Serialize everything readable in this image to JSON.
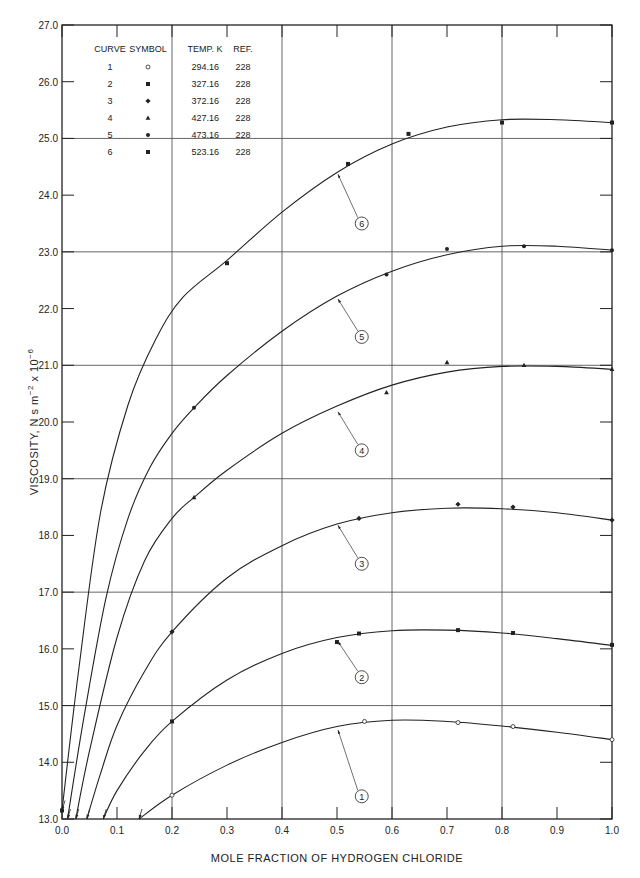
{
  "chart_data": {
    "type": "line",
    "title": "",
    "xlabel": "MOLE FRACTION OF HYDROGEN CHLORIDE",
    "ylabel": "VISCOSITY, N s m^-2 x 10^-6",
    "xlim": [
      0.0,
      1.0
    ],
    "ylim": [
      13.0,
      27.0
    ],
    "x_ticks": [
      "0.0",
      "0.1",
      "0.2",
      "0.3",
      "0.4",
      "0.5",
      "0.6",
      "0.7",
      "0.8",
      "0.9",
      "1.0"
    ],
    "y_ticks": [
      "13.0",
      "14.0",
      "15.0",
      "16.0",
      "17.0",
      "18.0",
      "19.0",
      "20.0",
      "21.0",
      "22.0",
      "23.0",
      "24.0",
      "25.0",
      "26.0",
      "27.0"
    ],
    "grid": {
      "x_major": [
        0.2,
        0.4,
        0.6,
        0.8
      ],
      "y_major": [
        15,
        17,
        19,
        21,
        23,
        25
      ]
    },
    "legend": {
      "position": "upper-left",
      "headers": [
        "CURVE",
        "SYMBOL",
        "TEMP. K",
        "REF."
      ],
      "rows": [
        {
          "curve": "1",
          "symbol": "open-circle",
          "temp": "294.16",
          "ref": "228"
        },
        {
          "curve": "2",
          "symbol": "filled-square",
          "temp": "327.16",
          "ref": "228"
        },
        {
          "curve": "3",
          "symbol": "filled-diamond",
          "temp": "372.16",
          "ref": "228"
        },
        {
          "curve": "4",
          "symbol": "filled-triangle",
          "temp": "427.16",
          "ref": "228"
        },
        {
          "curve": "5",
          "symbol": "filled-circle",
          "temp": "473.16",
          "ref": "228"
        },
        {
          "curve": "6",
          "symbol": "filled-square",
          "temp": "523.16",
          "ref": "228"
        }
      ]
    },
    "series": [
      {
        "name": "1",
        "temp_K": 294.16,
        "symbol": "open-circle",
        "curve": [
          [
            0.14,
            13.0
          ],
          [
            0.2,
            13.42
          ],
          [
            0.3,
            13.95
          ],
          [
            0.4,
            14.35
          ],
          [
            0.5,
            14.63
          ],
          [
            0.6,
            14.74
          ],
          [
            0.7,
            14.72
          ],
          [
            0.8,
            14.64
          ],
          [
            0.9,
            14.53
          ],
          [
            1.0,
            14.4
          ]
        ],
        "points": [
          [
            0.2,
            13.42
          ],
          [
            0.55,
            14.72
          ],
          [
            0.72,
            14.7
          ],
          [
            0.82,
            14.63
          ],
          [
            1.0,
            14.4
          ]
        ],
        "label_pos": [
          0.545,
          13.4
        ],
        "arrow_to": [
          0.5,
          14.62
        ]
      },
      {
        "name": "2",
        "temp_K": 327.16,
        "symbol": "filled-square",
        "curve": [
          [
            0.075,
            13.0
          ],
          [
            0.1,
            13.5
          ],
          [
            0.15,
            14.2
          ],
          [
            0.2,
            14.72
          ],
          [
            0.3,
            15.45
          ],
          [
            0.4,
            15.92
          ],
          [
            0.5,
            16.2
          ],
          [
            0.6,
            16.32
          ],
          [
            0.7,
            16.33
          ],
          [
            0.8,
            16.28
          ],
          [
            0.9,
            16.18
          ],
          [
            1.0,
            16.06
          ]
        ],
        "points": [
          [
            0.2,
            14.72
          ],
          [
            0.5,
            16.12
          ],
          [
            0.54,
            16.27
          ],
          [
            0.72,
            16.33
          ],
          [
            0.82,
            16.28
          ],
          [
            1.0,
            16.07
          ]
        ],
        "label_pos": [
          0.545,
          15.5
        ],
        "arrow_to": [
          0.5,
          16.18
        ]
      },
      {
        "name": "3",
        "temp_K": 372.16,
        "symbol": "filled-diamond",
        "curve": [
          [
            0.045,
            13.0
          ],
          [
            0.07,
            13.8
          ],
          [
            0.1,
            14.65
          ],
          [
            0.15,
            15.6
          ],
          [
            0.2,
            16.3
          ],
          [
            0.3,
            17.25
          ],
          [
            0.4,
            17.82
          ],
          [
            0.5,
            18.2
          ],
          [
            0.6,
            18.4
          ],
          [
            0.7,
            18.48
          ],
          [
            0.8,
            18.47
          ],
          [
            0.9,
            18.4
          ],
          [
            1.0,
            18.27
          ]
        ],
        "points": [
          [
            0.2,
            16.3
          ],
          [
            0.54,
            18.3
          ],
          [
            0.72,
            18.55
          ],
          [
            0.82,
            18.5
          ],
          [
            1.0,
            18.27
          ]
        ],
        "label_pos": [
          0.545,
          17.5
        ],
        "arrow_to": [
          0.5,
          18.23
        ]
      },
      {
        "name": "4",
        "temp_K": 427.16,
        "symbol": "filled-triangle",
        "curve": [
          [
            0.025,
            13.0
          ],
          [
            0.05,
            14.2
          ],
          [
            0.1,
            16.2
          ],
          [
            0.15,
            17.55
          ],
          [
            0.2,
            18.3
          ],
          [
            0.24,
            18.67
          ],
          [
            0.3,
            19.15
          ],
          [
            0.4,
            19.8
          ],
          [
            0.5,
            20.28
          ],
          [
            0.6,
            20.65
          ],
          [
            0.7,
            20.88
          ],
          [
            0.8,
            20.98
          ],
          [
            0.9,
            20.98
          ],
          [
            1.0,
            20.93
          ]
        ],
        "points": [
          [
            0.24,
            18.67
          ],
          [
            0.59,
            20.52
          ],
          [
            0.7,
            21.05
          ],
          [
            0.84,
            21.0
          ],
          [
            1.0,
            20.93
          ]
        ],
        "label_pos": [
          0.545,
          19.5
        ],
        "arrow_to": [
          0.5,
          20.23
        ]
      },
      {
        "name": "5",
        "temp_K": 473.16,
        "symbol": "filled-circle",
        "curve": [
          [
            0.01,
            13.0
          ],
          [
            0.04,
            14.8
          ],
          [
            0.08,
            16.9
          ],
          [
            0.12,
            18.3
          ],
          [
            0.16,
            19.2
          ],
          [
            0.2,
            19.8
          ],
          [
            0.24,
            20.25
          ],
          [
            0.3,
            20.82
          ],
          [
            0.4,
            21.6
          ],
          [
            0.5,
            22.22
          ],
          [
            0.6,
            22.66
          ],
          [
            0.7,
            22.95
          ],
          [
            0.8,
            23.1
          ],
          [
            0.9,
            23.1
          ],
          [
            1.0,
            23.03
          ]
        ],
        "points": [
          [
            0.24,
            20.25
          ],
          [
            0.59,
            22.6
          ],
          [
            0.7,
            23.05
          ],
          [
            0.84,
            23.1
          ],
          [
            1.0,
            23.03
          ]
        ],
        "label_pos": [
          0.545,
          21.5
        ],
        "arrow_to": [
          0.5,
          22.22
        ]
      },
      {
        "name": "6",
        "temp_K": 523.16,
        "symbol": "filled-square",
        "curve": [
          [
            0.0,
            13.15
          ],
          [
            0.03,
            15.6
          ],
          [
            0.07,
            18.4
          ],
          [
            0.12,
            20.3
          ],
          [
            0.17,
            21.45
          ],
          [
            0.22,
            22.2
          ],
          [
            0.3,
            22.85
          ],
          [
            0.4,
            23.7
          ],
          [
            0.5,
            24.4
          ],
          [
            0.6,
            24.9
          ],
          [
            0.7,
            25.2
          ],
          [
            0.8,
            25.33
          ],
          [
            0.9,
            25.33
          ],
          [
            1.0,
            25.28
          ]
        ],
        "points": [
          [
            0.0,
            13.15
          ],
          [
            0.3,
            22.8
          ],
          [
            0.52,
            24.55
          ],
          [
            0.63,
            25.08
          ],
          [
            0.8,
            25.28
          ],
          [
            1.0,
            25.28
          ]
        ],
        "label_pos": [
          0.545,
          23.5
        ],
        "arrow_to": [
          0.5,
          24.42
        ]
      }
    ]
  }
}
